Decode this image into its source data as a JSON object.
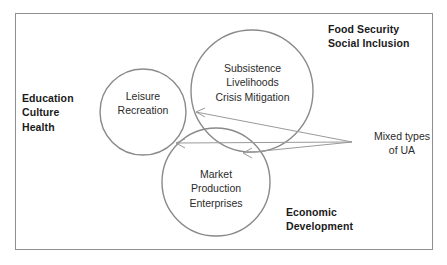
{
  "diagram": {
    "frame_color": "#8f8f8f",
    "circle_stroke": "#8a8a8a",
    "arrow_color": "#9a9a9a",
    "outer_labels": [
      {
        "name": "education-culture-health",
        "text": "Education\nCulture\nHealth",
        "weight": "bold",
        "align": "left"
      },
      {
        "name": "food-security-social-inclusion",
        "text": "Food Security\nSocial Inclusion",
        "weight": "bold",
        "align": "left"
      },
      {
        "name": "economic-development",
        "text": "Economic\nDevelopment",
        "weight": "bold",
        "align": "left"
      },
      {
        "name": "mixed-types-of-ua",
        "text": "Mixed types\nof UA",
        "weight": "normal",
        "align": "center"
      }
    ],
    "circles": [
      {
        "name": "leisure-recreation-circle",
        "text": "Leisure\nRecreation",
        "cx": 143,
        "cy": 112,
        "r": 43
      },
      {
        "name": "subsistence-livelihoods-circle",
        "text": "Subsistence\nLivelihoods\nCrisis Mitigation",
        "cx": 252,
        "cy": 91,
        "r": 61
      },
      {
        "name": "market-production-circle",
        "text": "Market\nProduction\nEnterprises",
        "cx": 216,
        "cy": 182,
        "r": 54
      }
    ],
    "arrows": [
      {
        "name": "arrow-to-leisure-subsistence-overlap",
        "from_x": 352,
        "from_y": 142,
        "to_x": 196,
        "to_y": 112
      },
      {
        "name": "arrow-to-triple-overlap",
        "from_x": 352,
        "from_y": 142,
        "to_x": 176,
        "to_y": 143
      },
      {
        "name": "arrow-to-subsistence-market-overlap",
        "from_x": 352,
        "from_y": 142,
        "to_x": 243,
        "to_y": 153
      }
    ]
  }
}
